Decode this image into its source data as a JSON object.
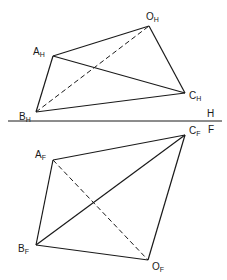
{
  "diagram": {
    "title": "",
    "fold_line": {
      "y": 121,
      "x1": 8,
      "x2": 222,
      "upper_label": "H",
      "lower_label": "F"
    },
    "top_view": {
      "name": "horizontal-projection",
      "points": {
        "O": {
          "label": "O",
          "sub": "H",
          "x": 149,
          "y": 26
        },
        "A": {
          "label": "A",
          "sub": "H",
          "x": 53,
          "y": 56
        },
        "B": {
          "label": "B",
          "sub": "H",
          "x": 36,
          "y": 112
        },
        "C": {
          "label": "C",
          "sub": "H",
          "x": 185,
          "y": 93
        }
      },
      "visible_edges": [
        [
          "A",
          "O"
        ],
        [
          "O",
          "C"
        ],
        [
          "A",
          "C"
        ],
        [
          "A",
          "B"
        ],
        [
          "B",
          "C"
        ]
      ],
      "hidden_edges": [
        [
          "B",
          "O"
        ]
      ]
    },
    "front_view": {
      "name": "frontal-projection",
      "points": {
        "C": {
          "label": "C",
          "sub": "F",
          "x": 185,
          "y": 135
        },
        "A": {
          "label": "A",
          "sub": "F",
          "x": 53,
          "y": 160
        },
        "B": {
          "label": "B",
          "sub": "F",
          "x": 36,
          "y": 245
        },
        "O": {
          "label": "O",
          "sub": "F",
          "x": 148,
          "y": 260
        }
      },
      "visible_edges": [
        [
          "A",
          "C"
        ],
        [
          "C",
          "O"
        ],
        [
          "B",
          "C"
        ],
        [
          "A",
          "B"
        ],
        [
          "B",
          "O"
        ]
      ],
      "hidden_edges": [
        [
          "A",
          "O"
        ]
      ]
    }
  }
}
